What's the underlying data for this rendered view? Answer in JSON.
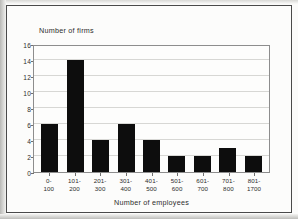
{
  "chart_data": {
    "type": "bar",
    "title": "",
    "xlabel": "Number of employees",
    "ylabel": "Number of firms",
    "ylim": [
      0,
      16
    ],
    "yticks": [
      0,
      2,
      4,
      6,
      8,
      10,
      12,
      14,
      16
    ],
    "grid": true,
    "legend": null,
    "categories": [
      "0-100",
      "101-200",
      "201-300",
      "301-400",
      "401-500",
      "501-600",
      "601-700",
      "701-800",
      "801-1700"
    ],
    "category_lines": [
      {
        "line1": "0-",
        "line2": "100"
      },
      {
        "line1": "101-",
        "line2": "200"
      },
      {
        "line1": "201-",
        "line2": "300"
      },
      {
        "line1": "301-",
        "line2": "400"
      },
      {
        "line1": "401-",
        "line2": "500"
      },
      {
        "line1": "501-",
        "line2": "600"
      },
      {
        "line1": "601-",
        "line2": "700"
      },
      {
        "line1": "701-",
        "line2": "800"
      },
      {
        "line1": "801-",
        "line2": "1700"
      }
    ],
    "values": [
      6,
      14,
      4,
      6,
      4,
      2,
      2,
      3,
      2
    ],
    "bar_color": "#0d0d0d"
  }
}
